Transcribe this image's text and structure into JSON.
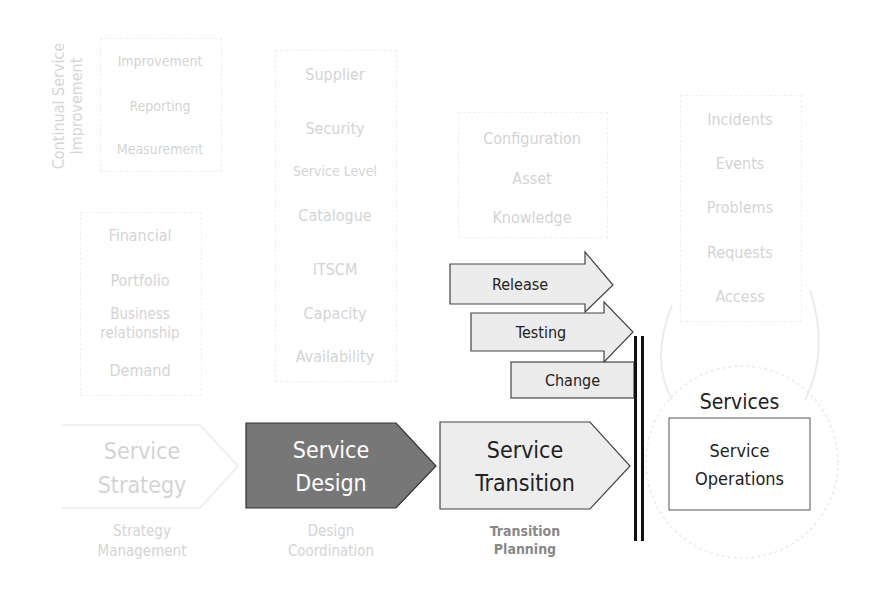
{
  "csi": {
    "vertical_title_line1": "Continual Service",
    "vertical_title_line2": "Improvement",
    "items": [
      "Improvement",
      "Reporting",
      "Measurement"
    ]
  },
  "strategy": {
    "items": [
      "Financial",
      "Portfolio",
      "Business",
      "relationship",
      "Demand"
    ],
    "title_line1": "Service",
    "title_line2": "Strategy",
    "sub_line1": "Strategy",
    "sub_line2": "Management"
  },
  "design": {
    "items": [
      "Supplier",
      "Security",
      "Service Level",
      "Catalogue",
      "ITSCM",
      "Capacity",
      "Availability"
    ],
    "title_line1": "Service",
    "title_line2": "Design",
    "sub_line1": "Design",
    "sub_line2": "Coordination",
    "fill": "#777777"
  },
  "transition": {
    "items": [
      "Configuration",
      "Asset",
      "Knowledge"
    ],
    "arrows": [
      "Release",
      "Testing",
      "Change"
    ],
    "title_line1": "Service",
    "title_line2": "Transition",
    "sub_line1": "Transition",
    "sub_line2": "Planning",
    "fill": "#ededed"
  },
  "operations": {
    "items": [
      "Incidents",
      "Events",
      "Problems",
      "Requests",
      "Access"
    ],
    "services_label": "Services",
    "title_line1": "Service",
    "title_line2": "Operations"
  }
}
